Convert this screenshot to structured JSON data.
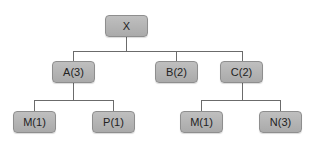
{
  "diagram": {
    "type": "tree",
    "root": {
      "label": "X"
    },
    "level2": [
      {
        "label": "A(3)"
      },
      {
        "label": "B(2)"
      },
      {
        "label": "C(2)"
      }
    ],
    "level3": [
      {
        "label": "M(1)",
        "parent": "A(3)"
      },
      {
        "label": "P(1)",
        "parent": "A(3)"
      },
      {
        "label": "M(1)",
        "parent": "C(2)"
      },
      {
        "label": "N(3)",
        "parent": "C(2)"
      }
    ],
    "colors": {
      "node_fill": "#b5b5b5",
      "node_border": "#8e8e8e",
      "edge": "#6b6b6b"
    }
  }
}
